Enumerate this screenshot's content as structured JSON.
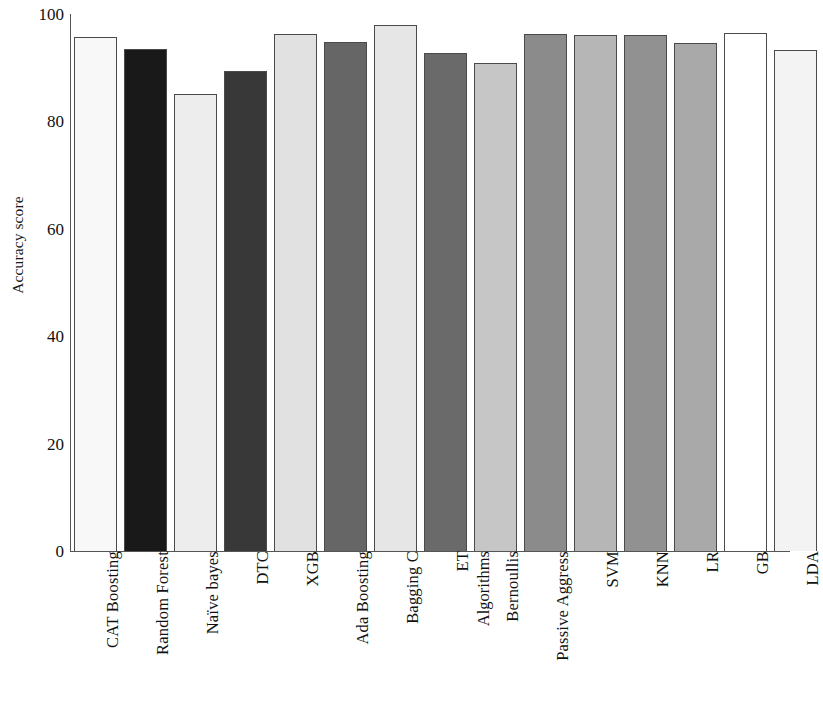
{
  "chart_data": {
    "type": "bar",
    "title": "",
    "subtitle": "",
    "xlabel": "Algorithms",
    "ylabel": "Accuracy score",
    "ylim": [
      0,
      100
    ],
    "yticks": [
      0,
      20,
      40,
      60,
      80,
      100
    ],
    "grid": false,
    "legend": "none",
    "categories": [
      "CAT Boosting",
      "Random Forest",
      "Naïve bayes",
      "DTC",
      "XGB",
      "Ada Boosting",
      "Bagging C",
      "ET",
      "Bernoullis",
      "Passive Aggress",
      "SVM",
      "KNN",
      "LR",
      "GB",
      "LDA"
    ],
    "values": [
      95.7,
      93.5,
      85.1,
      89.4,
      96.3,
      94.8,
      98.0,
      92.7,
      90.9,
      96.3,
      96.1,
      96.1,
      94.6,
      96.5,
      93.3
    ],
    "bar_colors": [
      "#f8f8f8",
      "#191919",
      "#ededed",
      "#383838",
      "#e1e1e1",
      "#666666",
      "#e6e6e6",
      "#6a6a6a",
      "#c6c6c6",
      "#8b8b8b",
      "#b6b6b6",
      "#919191",
      "#a9a9a9",
      "#ffffff",
      "#f3f3f3"
    ],
    "bar_edge_color": "#4a4a4a",
    "axis_color": "#555555",
    "text_color": "#111111",
    "background": "#ffffff"
  }
}
